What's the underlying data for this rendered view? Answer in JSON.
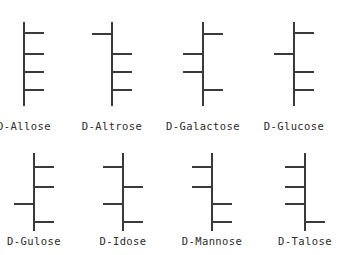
{
  "figure": {
    "title": "",
    "line_color": "#3a3a3a",
    "text_color": "#2b2b2b",
    "background_color": "#ffffff"
  },
  "chart_data": {
    "type": "diagram",
    "title": "",
    "xlabel": "",
    "ylabel": "",
    "molecules": [
      {
        "name": "D-Allose",
        "row": 0,
        "column": 0,
        "backbone_x": 24,
        "backbone_top": 22,
        "backbone_bottom": 106,
        "substituents": [
          {
            "carbon": 2,
            "side": "right",
            "y": 33
          },
          {
            "carbon": 3,
            "side": "right",
            "y": 54
          },
          {
            "carbon": 4,
            "side": "right",
            "y": 72
          },
          {
            "carbon": 5,
            "side": "right",
            "y": 90
          }
        ]
      },
      {
        "name": "D-Altrose",
        "row": 0,
        "column": 1,
        "backbone_x": 112,
        "backbone_top": 22,
        "backbone_bottom": 106,
        "substituents": [
          {
            "carbon": 2,
            "side": "left",
            "y": 34
          },
          {
            "carbon": 3,
            "side": "right",
            "y": 54
          },
          {
            "carbon": 4,
            "side": "right",
            "y": 72
          },
          {
            "carbon": 5,
            "side": "right",
            "y": 90
          }
        ]
      },
      {
        "name": "D-Galactose",
        "row": 0,
        "column": 2,
        "backbone_x": 203,
        "backbone_top": 22,
        "backbone_bottom": 106,
        "substituents": [
          {
            "carbon": 2,
            "side": "right",
            "y": 34
          },
          {
            "carbon": 3,
            "side": "left",
            "y": 54
          },
          {
            "carbon": 4,
            "side": "left",
            "y": 72
          },
          {
            "carbon": 5,
            "side": "right",
            "y": 90
          }
        ]
      },
      {
        "name": "D-Glucose",
        "row": 0,
        "column": 3,
        "backbone_x": 294,
        "backbone_top": 22,
        "backbone_bottom": 106,
        "substituents": [
          {
            "carbon": 2,
            "side": "right",
            "y": 33
          },
          {
            "carbon": 3,
            "side": "left",
            "y": 54
          },
          {
            "carbon": 4,
            "side": "right",
            "y": 72
          },
          {
            "carbon": 5,
            "side": "right",
            "y": 90
          }
        ]
      },
      {
        "name": "D-Gulose",
        "row": 1,
        "column": 0,
        "backbone_x": 34,
        "backbone_top": 8,
        "backbone_bottom": 86,
        "substituents": [
          {
            "carbon": 2,
            "side": "right",
            "y": 22
          },
          {
            "carbon": 3,
            "side": "right",
            "y": 42
          },
          {
            "carbon": 4,
            "side": "left",
            "y": 59
          },
          {
            "carbon": 5,
            "side": "right",
            "y": 77
          }
        ]
      },
      {
        "name": "D-Idose",
        "row": 1,
        "column": 1,
        "backbone_x": 123,
        "backbone_top": 8,
        "backbone_bottom": 86,
        "substituents": [
          {
            "carbon": 2,
            "side": "left",
            "y": 22
          },
          {
            "carbon": 3,
            "side": "right",
            "y": 42
          },
          {
            "carbon": 4,
            "side": "left",
            "y": 59
          },
          {
            "carbon": 5,
            "side": "right",
            "y": 77
          }
        ]
      },
      {
        "name": "D-Mannose",
        "row": 1,
        "column": 2,
        "backbone_x": 212,
        "backbone_top": 8,
        "backbone_bottom": 86,
        "substituents": [
          {
            "carbon": 2,
            "side": "left",
            "y": 22
          },
          {
            "carbon": 3,
            "side": "left",
            "y": 42
          },
          {
            "carbon": 4,
            "side": "right",
            "y": 59
          },
          {
            "carbon": 5,
            "side": "right",
            "y": 77
          }
        ]
      },
      {
        "name": "D-Talose",
        "row": 1,
        "column": 3,
        "backbone_x": 305,
        "backbone_top": 8,
        "backbone_bottom": 86,
        "substituents": [
          {
            "carbon": 2,
            "side": "left",
            "y": 22
          },
          {
            "carbon": 3,
            "side": "left",
            "y": 42
          },
          {
            "carbon": 4,
            "side": "left",
            "y": 59
          },
          {
            "carbon": 5,
            "side": "right",
            "y": 77
          }
        ]
      }
    ]
  }
}
